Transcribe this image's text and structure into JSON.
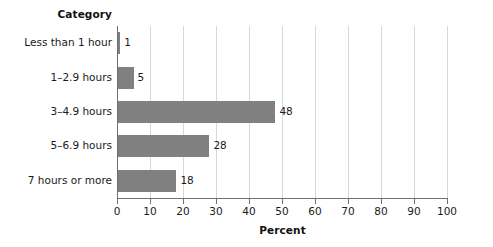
{
  "chart_data": {
    "type": "bar",
    "orientation": "horizontal",
    "title": "",
    "categories": [
      "Less than 1 hour",
      "1–2.9 hours",
      "3–4.9 hours",
      "5–6.9 hours",
      "7 hours or more"
    ],
    "values": [
      1,
      5,
      48,
      28,
      18
    ],
    "data_labels": [
      "1",
      "5",
      "48",
      "28",
      "18"
    ],
    "xlabel": "Percent",
    "ylabel": "Category",
    "xlim": [
      0,
      100
    ],
    "xticks": [
      0,
      10,
      20,
      30,
      40,
      50,
      60,
      70,
      80,
      90,
      100
    ],
    "xtick_labels": [
      "0",
      "10",
      "20",
      "30",
      "40",
      "50",
      "60",
      "70",
      "80",
      "90",
      "100"
    ],
    "grid": "vertical",
    "legend": "none",
    "bar_color": "#808080",
    "gridline_color": "#d8d8d8",
    "axis_color": "#6f6f6f",
    "background_color": "#ffffff"
  }
}
